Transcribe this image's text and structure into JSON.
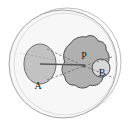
{
  "figure": {
    "background_color": "#ffffff"
  },
  "colors": {
    "background": "#ffffff",
    "outer_circle_fill": "#f7f7f7",
    "outer_circle_stroke": "#9a9a9a",
    "offset_circle_stroke": "#b4b4b4",
    "ellipse_fill": "#c2c2c2",
    "ellipse_stroke": "#6e6e6e",
    "blob_fill": "#b0b0b0",
    "blob_stroke": "#4a4a4a",
    "small_circle_fill": "#d8d8d8",
    "small_circle_stroke": "#4a4a4a",
    "axis_line": "#585858",
    "dashed_line": "#6a6a6a",
    "label_color": "#1a1a1a"
  },
  "shapes": {
    "outer_circle": {
      "name": "outer-boundary-circle",
      "cx": 63,
      "cy": 64,
      "r": 54
    },
    "offset_circle": {
      "name": "offset-boundary-circle",
      "cx": 67,
      "cy": 62,
      "r": 54
    },
    "ellipse_a": {
      "name": "source-ellipse-a",
      "cx": 40,
      "cy": 64,
      "rx": 16,
      "ry": 20
    },
    "blob_p": {
      "name": "irregular-blob-p",
      "cx": 85,
      "cy": 64
    },
    "small_circle_b": {
      "name": "small-circle-b",
      "cx": 101,
      "cy": 68,
      "r": 9
    },
    "point_p": {
      "name": "convergence-point-p",
      "x": 84,
      "y": 66
    }
  },
  "lines": {
    "axis": {
      "name": "axis-line",
      "x1": 40,
      "y1": 64,
      "x2": 85,
      "y2": 65,
      "style": "solid"
    },
    "cone_upper": {
      "name": "cone-line-upper",
      "x1": 47,
      "y1": 49,
      "x2": 84,
      "y2": 66,
      "style": "dashed"
    },
    "cone_lower": {
      "name": "cone-line-lower",
      "x1": 47,
      "y1": 80,
      "x2": 84,
      "y2": 66,
      "style": "dashed"
    },
    "ray_upper_right": {
      "name": "ray-upper-right",
      "x1": 84,
      "y1": 66,
      "x2": 112,
      "y2": 57,
      "style": "dashed"
    },
    "ray_lower_right": {
      "name": "ray-lower-right",
      "x1": 84,
      "y1": 66,
      "x2": 114,
      "y2": 78,
      "style": "dashed"
    },
    "ray_left_upper": {
      "name": "ray-left-upper",
      "x1": 84,
      "y1": 66,
      "x2": 20,
      "y2": 53,
      "style": "dashed-faint"
    }
  },
  "labels": {
    "a": "A",
    "p": "P",
    "b": "B"
  }
}
